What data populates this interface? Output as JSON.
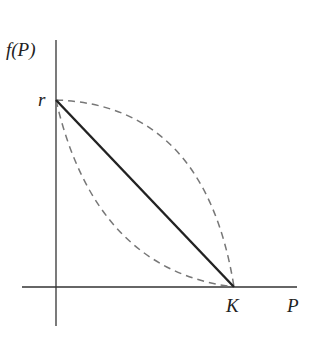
{
  "diagram": {
    "title": "",
    "y_axis_label": "f(P)",
    "x_axis_label": "P",
    "y_intercept_label": "r",
    "x_intercept_label": "K",
    "curves": [
      {
        "name": "linear",
        "style": "solid",
        "color": "#222222",
        "from": "(0, r)",
        "to": "(K, 0)"
      },
      {
        "name": "concave",
        "style": "dashed",
        "color": "#777777",
        "from": "(0, r)",
        "to": "(K, 0)"
      },
      {
        "name": "convex",
        "style": "dashed",
        "color": "#777777",
        "from": "(0, r)",
        "to": "(K, 0)"
      }
    ]
  }
}
